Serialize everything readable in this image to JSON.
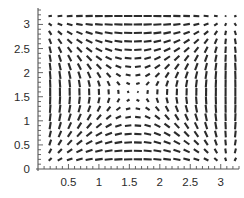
{
  "figure": {
    "type": "vector-field-plot",
    "background_color": "#ffffff",
    "segment_color": "#2b2b2b",
    "axis_color": "#555555",
    "label_color": "#2b2b2b",
    "width": 244,
    "height": 198
  },
  "axes": {
    "x_axis": {
      "name": "x-axis",
      "position_value": 0,
      "range": [
        0,
        3.3
      ],
      "major_ticks": [
        0.5,
        1,
        1.5,
        2,
        2.5,
        3
      ],
      "major_tick_labels": [
        "0.5",
        "1",
        "1.5",
        "2",
        "2.5",
        "3"
      ],
      "minor_tick_step": 0.1,
      "tick_direction": "up"
    },
    "y_axis": {
      "name": "y-axis",
      "position_value": 0,
      "range": [
        0,
        3.3
      ],
      "major_ticks": [
        0,
        0.5,
        1,
        1.5,
        2,
        2.5,
        3
      ],
      "major_tick_labels": [
        "0",
        "0.5",
        "1",
        "1.5",
        "2",
        "2.5",
        "3"
      ],
      "minor_tick_step": 0.1,
      "tick_direction": "right"
    },
    "origin_label": "0"
  },
  "chart_data": {
    "type": "scatter",
    "subtype": "vector-field",
    "title": "",
    "xlabel": "",
    "ylabel": "",
    "xlim": [
      0,
      3.3
    ],
    "ylim": [
      0,
      3.3
    ],
    "grid": false,
    "legend": "none",
    "field_definition": {
      "u": "sin(x) * cos(y)",
      "v": "cos(x) * sin(y)",
      "description": "Direction field of short line segments; angle = atan2(v,u), length scales with sqrt(u^2+v^2)"
    },
    "grid_spec": {
      "x_start": 0.2,
      "x_step": 0.16,
      "x_count": 20,
      "y_start": 0.2,
      "y_step": 0.175,
      "y_count": 18
    },
    "segment_style": {
      "max_half_length_px": 4.2,
      "stroke_width_px": 2.1,
      "linecap": "butt"
    }
  },
  "tick_geometry": {
    "major_length_px": 5,
    "minor_length_px": 3,
    "axis_stroke_width": 1.1,
    "tick_stroke_width": 0.9
  },
  "plot_area": {
    "left_px": 38,
    "right_px": 239,
    "top_px": 10,
    "bottom_px": 169
  }
}
